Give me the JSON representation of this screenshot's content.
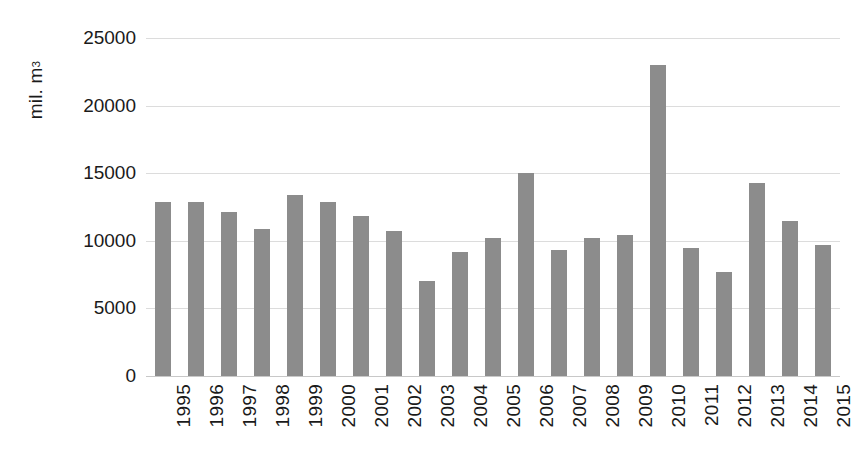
{
  "chart_data": {
    "type": "bar",
    "title": "",
    "xlabel": "",
    "ylabel": "mil. m3",
    "ylabel_text": "mil. m",
    "ylabel_superscript": "3",
    "categories": [
      "1995",
      "1996",
      "1997",
      "1998",
      "1999",
      "2000",
      "2001",
      "2002",
      "2003",
      "2004",
      "2005",
      "2006",
      "2007",
      "2008",
      "2009",
      "2010",
      "2011",
      "2012",
      "2013",
      "2014",
      "2015"
    ],
    "values": [
      12850,
      12900,
      12100,
      10900,
      13400,
      12900,
      11800,
      10700,
      7000,
      9200,
      10200,
      15000,
      9300,
      10200,
      10400,
      23000,
      9450,
      7700,
      14250,
      11450,
      9700
    ],
    "ylim": [
      0,
      25000
    ],
    "ytick_labels": [
      "0",
      "5000",
      "10000",
      "15000",
      "20000",
      "25000"
    ],
    "ytick_values": [
      0,
      5000,
      10000,
      15000,
      20000,
      25000
    ],
    "grid": true,
    "legend": false,
    "legend_position": "none",
    "bar_color": "#8c8c8c",
    "gridline_color": "#dcdcdc",
    "background_color": "#ffffff",
    "text_color": "#1a1a1a",
    "xtick_rotation": -90
  }
}
